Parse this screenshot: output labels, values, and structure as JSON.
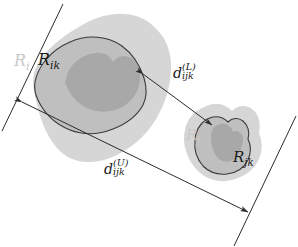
{
  "figure": {
    "background": "#ffffff",
    "width": 298,
    "height": 247
  },
  "colors": {
    "outer_blob": "#d6d6d6",
    "mid_blob": "#bfbfbf",
    "inner_blob": "#a8a8a8",
    "outline": "#3a3a3a",
    "line": "#2b2b2b",
    "label_dark": "#1a1a1a",
    "label_faint": "#c9c9c9"
  },
  "labels": {
    "region_i": {
      "base": "R",
      "sub": "i",
      "style": "faint"
    },
    "region_ik": {
      "base": "R",
      "sub": "ik",
      "style": "dark"
    },
    "region_j": {
      "base": "R",
      "sub": "j",
      "style": "faint"
    },
    "region_jk": {
      "base": "R",
      "sub": "jk",
      "style": "dark"
    },
    "distance_lower": {
      "base": "d",
      "sup": "(L)",
      "sub": "ijk",
      "style": "dark"
    },
    "distance_upper": {
      "base": "d",
      "sup": "(U)",
      "sub": "ijk",
      "style": "dark"
    }
  },
  "geometry": {
    "tangent_line_left": {
      "x1": 63,
      "y1": 4,
      "x2": 2,
      "y2": 131
    },
    "tangent_line_right": {
      "x1": 296,
      "y1": 116,
      "x2": 234,
      "y2": 246
    },
    "arrow_lower": {
      "x1": 143,
      "y1": 74,
      "x2": 212,
      "y2": 125,
      "double_headed": true
    },
    "arrow_upper": {
      "x1": 22,
      "y1": 102,
      "x2": 248,
      "y2": 212,
      "double_headed": true
    }
  },
  "shapes": {
    "left_outer": "M 34,73 C 40,55 58,38 84,24 C 108,11 134,10 151,24 C 166,36 172,52 171,70 C 170,88 165,104 156,119 C 146,136 130,150 110,158 C 92,165 73,163 61,152 C 48,140 41,122 37,104 C 34,92 32,82 34,73 Z",
    "left_mid": "M 35,82 C 38,66 51,50 70,42 C 88,34 108,36 122,46 C 133,54 140,66 144,78 C 147,88 147,97 143,105 C 137,116 126,124 113,129 C 98,135 83,135 70,130 C 55,124 44,113 38,100 C 35,94 34,88 35,82 Z",
    "left_inner": "M 66,79 C 69,64 82,54 96,53 C 104,52 110,56 113,62 C 117,56 124,54 131,58 C 138,62 141,71 140,80 C 139,91 133,100 124,106 C 114,112 103,113 92,110 C 80,106 71,97 67,87 C 65,84 65,81 66,79 Z",
    "right_outer": "M 185,130 C 187,118 196,109 209,105 C 218,102 226,105 232,111 C 237,106 245,104 252,109 C 259,114 261,123 259,133 C 262,140 263,150 259,159 C 254,170 244,177 232,180 C 220,183 208,180 199,172 C 190,164 185,152 184,141 C 184,137 184,133 185,130 Z",
    "right_mid": "M 196,134 C 198,126 204,119 213,117 C 219,116 224,118 228,122 C 232,118 238,117 243,121 C 248,125 250,132 248,139 C 251,145 251,153 248,160 C 244,168 236,173 227,174 C 218,175 209,172 203,166 C 197,159 194,150 195,141 C 195,138 195,136 196,134 Z",
    "right_inner": "M 212,131 C 214,126 219,123 225,124 C 229,125 232,128 233,132 C 236,130 240,131 242,135 C 244,139 243,144 241,148 C 240,154 236,159 231,161 C 226,163 220,161 217,157 C 213,152 211,145 211,138 C 211,135 211,133 212,131 Z"
  }
}
